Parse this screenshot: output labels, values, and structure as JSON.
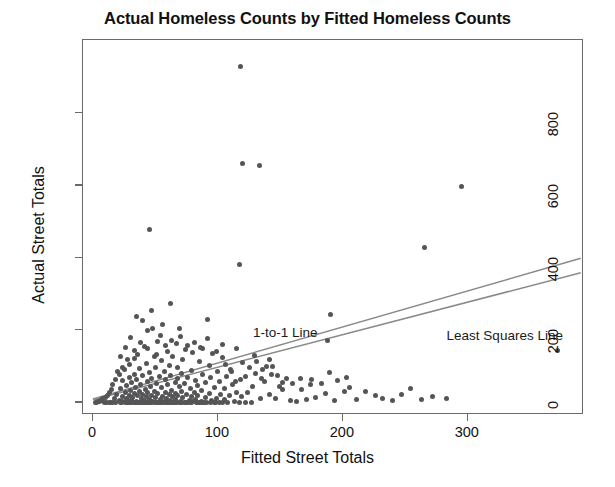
{
  "chart_data": {
    "type": "scatter",
    "title": "Actual Homeless Counts by Fitted Homeless Counts",
    "xlabel": "Fitted Street Totals",
    "ylabel": "Actual Street Totals",
    "xlim": [
      -8,
      393
    ],
    "ylim": [
      -35,
      1002
    ],
    "xticks": [
      0,
      100,
      200,
      300
    ],
    "yticks": [
      0,
      200,
      400,
      600,
      800
    ],
    "grid": false,
    "legend_position": "inline-annotations",
    "point_color": "#555558",
    "line_color": "#8a8a8a",
    "panel_border_color": "#6a6a6a",
    "background": "#ffffff",
    "annotations": [
      {
        "text": "1-to-1 Line",
        "x": 128,
        "y": 213
      },
      {
        "text": "Least Squares Line",
        "x": 283,
        "y": 205
      }
    ],
    "series": [
      {
        "name": "1-to-1 Line",
        "type": "line",
        "x": [
          0,
          392
        ],
        "y": [
          4,
          395
        ]
      },
      {
        "name": "Least Squares Line",
        "type": "line",
        "x": [
          0,
          392
        ],
        "y": [
          2,
          355
        ]
      },
      {
        "name": "Counts",
        "type": "scatter",
        "points": [
          [
            118,
            930
          ],
          [
            120,
            660
          ],
          [
            133,
            655
          ],
          [
            295,
            597
          ],
          [
            45,
            478
          ],
          [
            265,
            428
          ],
          [
            117,
            382
          ],
          [
            62,
            272
          ],
          [
            47,
            255
          ],
          [
            190,
            244
          ],
          [
            92,
            228
          ],
          [
            56,
            215
          ],
          [
            69,
            205
          ],
          [
            44,
            198
          ],
          [
            188,
            172
          ],
          [
            52,
            168
          ],
          [
            67,
            162
          ],
          [
            76,
            158
          ],
          [
            41,
            155
          ],
          [
            88,
            150
          ],
          [
            372,
            143
          ],
          [
            60,
            140
          ],
          [
            80,
            138
          ],
          [
            96,
            135
          ],
          [
            36,
            132
          ],
          [
            49,
            128
          ],
          [
            64,
            126
          ],
          [
            104,
            124
          ],
          [
            33,
            120
          ],
          [
            72,
            118
          ],
          [
            55,
            115
          ],
          [
            85,
            113
          ],
          [
            120,
            110
          ],
          [
            43,
            108
          ],
          [
            29,
            105
          ],
          [
            61,
            103
          ],
          [
            93,
            101
          ],
          [
            139,
            99
          ],
          [
            50,
            97
          ],
          [
            68,
            95
          ],
          [
            37,
            93
          ],
          [
            110,
            91
          ],
          [
            25,
            90
          ],
          [
            79,
            88
          ],
          [
            57,
            86
          ],
          [
            100,
            84
          ],
          [
            45,
            83
          ],
          [
            130,
            81
          ],
          [
            71,
            80
          ],
          [
            33,
            78
          ],
          [
            88,
            77
          ],
          [
            21,
            76
          ],
          [
            62,
            75
          ],
          [
            148,
            74
          ],
          [
            40,
            73
          ],
          [
            107,
            72
          ],
          [
            53,
            71
          ],
          [
            76,
            70
          ],
          [
            29,
            69
          ],
          [
            94,
            68
          ],
          [
            166,
            67
          ],
          [
            47,
            66
          ],
          [
            68,
            65
          ],
          [
            35,
            64
          ],
          [
            118,
            63
          ],
          [
            58,
            62
          ],
          [
            82,
            61
          ],
          [
            24,
            60
          ],
          [
            101,
            59
          ],
          [
            44,
            58
          ],
          [
            137,
            57
          ],
          [
            66,
            56
          ],
          [
            31,
            55
          ],
          [
            90,
            54
          ],
          [
            51,
            53
          ],
          [
            73,
            52
          ],
          [
            183,
            51
          ],
          [
            38,
            50
          ],
          [
            112,
            49
          ],
          [
            60,
            48
          ],
          [
            27,
            47
          ],
          [
            84,
            46
          ],
          [
            46,
            45
          ],
          [
            128,
            44
          ],
          [
            69,
            43
          ],
          [
            34,
            42
          ],
          [
            97,
            41
          ],
          [
            55,
            40
          ],
          [
            78,
            39
          ],
          [
            22,
            38
          ],
          [
            105,
            37
          ],
          [
            42,
            36
          ],
          [
            152,
            35
          ],
          [
            63,
            34
          ],
          [
            30,
            33
          ],
          [
            87,
            32
          ],
          [
            49,
            31
          ],
          [
            71,
            30
          ],
          [
            201,
            30
          ],
          [
            37,
            29
          ],
          [
            115,
            28
          ],
          [
            58,
            28
          ],
          [
            26,
            27
          ],
          [
            81,
            27
          ],
          [
            44,
            26
          ],
          [
            124,
            26
          ],
          [
            66,
            25
          ],
          [
            33,
            25
          ],
          [
            93,
            24
          ],
          [
            52,
            24
          ],
          [
            75,
            23
          ],
          [
            19,
            23
          ],
          [
            102,
            22
          ],
          [
            40,
            22
          ],
          [
            141,
            21
          ],
          [
            61,
            21
          ],
          [
            29,
            20
          ],
          [
            84,
            20
          ],
          [
            47,
            19
          ],
          [
            68,
            19
          ],
          [
            226,
            19
          ],
          [
            36,
            18
          ],
          [
            109,
            18
          ],
          [
            56,
            17
          ],
          [
            24,
            17
          ],
          [
            79,
            16
          ],
          [
            43,
            16
          ],
          [
            119,
            15
          ],
          [
            64,
            15
          ],
          [
            32,
            14
          ],
          [
            90,
            14
          ],
          [
            50,
            13
          ],
          [
            72,
            13
          ],
          [
            17,
            12
          ],
          [
            99,
            12
          ],
          [
            39,
            11
          ],
          [
            134,
            11
          ],
          [
            59,
            10
          ],
          [
            27,
            10
          ],
          [
            82,
            9
          ],
          [
            45,
            9
          ],
          [
            66,
            8
          ],
          [
            31,
            8
          ],
          [
            105,
            7
          ],
          [
            54,
            7
          ],
          [
            21,
            6
          ],
          [
            77,
            6
          ],
          [
            41,
            5
          ],
          [
            95,
            5
          ],
          [
            62,
            4
          ],
          [
            28,
            4
          ],
          [
            87,
            3
          ],
          [
            48,
            3
          ],
          [
            70,
            2
          ],
          [
            35,
            2
          ],
          [
            113,
            2
          ],
          [
            57,
            1
          ],
          [
            24,
            1
          ],
          [
            80,
            1
          ],
          [
            44,
            0
          ],
          [
            14,
            0
          ],
          [
            67,
            0
          ],
          [
            31,
            0
          ],
          [
            98,
            0
          ],
          [
            52,
            0
          ],
          [
            74,
            0
          ],
          [
            38,
            0
          ],
          [
            127,
            0
          ],
          [
            60,
            0
          ],
          [
            26,
            0
          ],
          [
            85,
            0
          ],
          [
            46,
            0
          ],
          [
            11,
            0
          ],
          [
            69,
            0
          ],
          [
            33,
            0
          ],
          [
            91,
            0
          ],
          [
            55,
            0
          ],
          [
            78,
            0
          ],
          [
            40,
            0
          ],
          [
            108,
            0
          ],
          [
            63,
            0
          ],
          [
            29,
            0
          ],
          [
            16,
            0
          ],
          [
            86,
            0
          ],
          [
            49,
            0
          ],
          [
            71,
            0
          ],
          [
            36,
            0
          ],
          [
            101,
            0
          ],
          [
            58,
            0
          ],
          [
            23,
            0
          ],
          [
            83,
            0
          ],
          [
            43,
            0
          ],
          [
            9,
            0
          ],
          [
            65,
            0
          ],
          [
            30,
            0
          ],
          [
            94,
            0
          ],
          [
            53,
            0
          ],
          [
            76,
            0
          ],
          [
            39,
            0
          ],
          [
            117,
            0
          ],
          [
            61,
            0
          ],
          [
            27,
            0
          ],
          [
            88,
            0
          ],
          [
            47,
            0
          ],
          [
            13,
            0
          ],
          [
            70,
            0
          ],
          [
            34,
            0
          ],
          [
            97,
            0
          ],
          [
            56,
            0
          ],
          [
            79,
            0
          ],
          [
            41,
            0
          ],
          [
            122,
            0
          ],
          [
            64,
            0
          ],
          [
            28,
            0
          ],
          [
            18,
            0
          ],
          [
            89,
            0
          ],
          [
            51,
            0
          ],
          [
            73,
            0
          ],
          [
            37,
            0
          ],
          [
            104,
            0
          ],
          [
            59,
            0
          ],
          [
            22,
            0
          ],
          [
            84,
            0
          ],
          [
            45,
            0
          ],
          [
            158,
            5
          ],
          [
            171,
            8
          ],
          [
            146,
            12
          ],
          [
            163,
            3
          ],
          [
            178,
            14
          ],
          [
            193,
            6
          ],
          [
            211,
            9
          ],
          [
            232,
            12
          ],
          [
            247,
            22
          ],
          [
            263,
            8
          ],
          [
            205,
            40
          ],
          [
            218,
            30
          ],
          [
            240,
            5
          ],
          [
            196,
            60
          ],
          [
            174,
            48
          ],
          [
            155,
            66
          ],
          [
            143,
            78
          ],
          [
            136,
            90
          ],
          [
            152,
            55
          ],
          [
            167,
            35
          ],
          [
            186,
            25
          ],
          [
            254,
            38
          ],
          [
            272,
            16
          ],
          [
            283,
            10
          ],
          [
            144,
            100
          ],
          [
            131,
            113
          ],
          [
            125,
            96
          ],
          [
            111,
            86
          ],
          [
            106,
            104
          ],
          [
            122,
            72
          ],
          [
            114,
            58
          ],
          [
            135,
            66
          ],
          [
            149,
            44
          ],
          [
            160,
            52
          ],
          [
            175,
            62
          ],
          [
            189,
            82
          ],
          [
            203,
            70
          ],
          [
            129,
            130
          ],
          [
            141,
            118
          ],
          [
            99,
            140
          ],
          [
            86,
            152
          ],
          [
            74,
            146
          ],
          [
            63,
            172
          ],
          [
            54,
            186
          ],
          [
            48,
            205
          ],
          [
            40,
            225
          ],
          [
            58,
            158
          ],
          [
            70,
            182
          ],
          [
            81,
            165
          ],
          [
            92,
            176
          ],
          [
            104,
            160
          ],
          [
            115,
            148
          ],
          [
            35,
            238
          ],
          [
            30,
            178
          ],
          [
            26,
            152
          ],
          [
            22,
            126
          ],
          [
            44,
            148
          ],
          [
            51,
            132
          ],
          [
            38,
            166
          ],
          [
            33,
            142
          ],
          [
            28,
            118
          ],
          [
            24,
            96
          ],
          [
            20,
            84
          ],
          [
            18,
            64
          ],
          [
            16,
            48
          ],
          [
            15,
            36
          ],
          [
            13,
            28
          ],
          [
            12,
            20
          ],
          [
            10,
            14
          ],
          [
            8,
            10
          ],
          [
            7,
            6
          ],
          [
            6,
            4
          ],
          [
            5,
            2
          ],
          [
            4,
            1
          ],
          [
            3,
            0
          ],
          [
            2,
            0
          ]
        ]
      }
    ]
  },
  "axis": {
    "x_tick_labels": [
      "0",
      "100",
      "200",
      "300"
    ],
    "y_tick_labels": [
      "0",
      "200",
      "400",
      "600",
      "800"
    ]
  }
}
